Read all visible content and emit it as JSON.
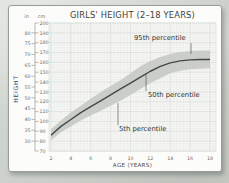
{
  "chart_data": {
    "type": "line",
    "title": "GIRLS' HEIGHT (2–18 YEARS)",
    "xlabel": "AGE (YEARS)",
    "ylabel": "HEIGHT",
    "unit_labels": {
      "left": "in",
      "right": "cm"
    },
    "x_ticks": [
      2,
      4,
      6,
      8,
      10,
      12,
      14,
      16,
      18
    ],
    "y_ticks_cm": [
      70,
      80,
      90,
      100,
      110,
      120,
      130,
      140,
      150,
      160,
      170,
      180,
      190,
      200
    ],
    "y_ticks_in": [
      30,
      35,
      40,
      45,
      50,
      55,
      60,
      65,
      70,
      75,
      80
    ],
    "xlim": [
      2,
      18
    ],
    "ylim_cm": [
      70,
      200
    ],
    "grid": "on",
    "x": [
      2,
      3,
      4,
      5,
      6,
      7,
      8,
      9,
      10,
      11,
      12,
      13,
      14,
      15,
      16,
      17,
      18
    ],
    "series": [
      {
        "name": "5th percentile",
        "values": [
          81,
          89,
          95,
          101,
          106,
          111,
          116,
          121,
          127,
          133,
          139,
          144,
          149,
          151.5,
          153,
          153.5,
          154
        ]
      },
      {
        "name": "50th percentile",
        "values": [
          86,
          95,
          102,
          109,
          115,
          121,
          127,
          133,
          139,
          145,
          151,
          156,
          159.5,
          161.5,
          162.5,
          163,
          163
        ]
      },
      {
        "name": "95th percentile",
        "values": [
          92,
          101,
          109,
          116,
          123,
          130,
          136,
          142,
          149,
          156,
          161.5,
          165.5,
          168.5,
          170.5,
          171.5,
          172,
          172
        ]
      }
    ],
    "legend": "labels placed on chart with leader lines",
    "colors": {
      "band": "#c3c7c2",
      "median_line": "#454845",
      "grid_major": "#d6dbd5",
      "grid_minor": "#e8ebe7",
      "plot_bg": "#f6f7f5",
      "axis": "#8a8f8a",
      "tick_text": "#6a6f6a",
      "leader": "#5a5e5a"
    }
  }
}
